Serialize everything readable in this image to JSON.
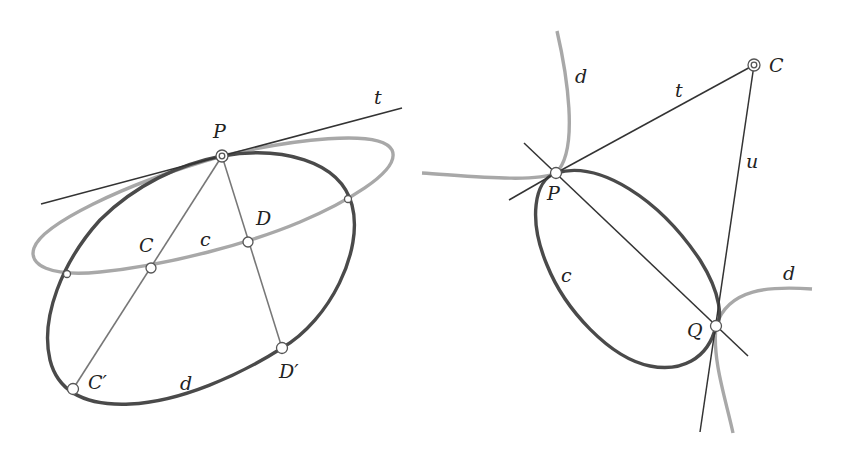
{
  "figures": [
    {
      "id": "left",
      "labels": {
        "t": "t",
        "P": "P",
        "C": "C",
        "c": "c",
        "D": "D",
        "C_prime": "C′",
        "d": "d",
        "D_prime": "D′"
      },
      "points": {
        "P": [
          222,
          156
        ],
        "C": [
          151,
          268
        ],
        "D": [
          248,
          242
        ],
        "C_prime": [
          73,
          389
        ],
        "D_prime": [
          282,
          348
        ],
        "X1": [
          67,
          274
        ],
        "X2": [
          348,
          199
        ]
      },
      "curves": {
        "c": {
          "style": "gray",
          "description": "conic c (gray ellipse), tangent to t at P"
        },
        "d": {
          "style": "dark",
          "description": "conic d (dark ellipse), tangent to t at P"
        },
        "t": {
          "style": "line",
          "description": "common tangent line at P"
        }
      }
    },
    {
      "id": "right",
      "labels": {
        "d_top": "d",
        "t": "t",
        "C": "C",
        "u": "u",
        "P": "P",
        "c": "c",
        "Q": "Q",
        "d_right": "d"
      },
      "points": {
        "C": [
          754,
          65
        ],
        "P": [
          556,
          173
        ],
        "Q": [
          716,
          326
        ]
      },
      "curves": {
        "c": {
          "style": "dark",
          "description": "conic c (dark ellipse) through P and Q"
        },
        "d": {
          "style": "gray",
          "description": "conic d (gray hyperbola) branches through P and Q"
        },
        "t": {
          "style": "line",
          "description": "line from P to C"
        },
        "u": {
          "style": "line",
          "description": "line from C through Q"
        }
      }
    }
  ],
  "colors": {
    "dark_curve": "#4a4a4a",
    "gray_curve": "#a8a8a8",
    "line": "#333333",
    "chord": "#777777",
    "background": "#ffffff"
  }
}
